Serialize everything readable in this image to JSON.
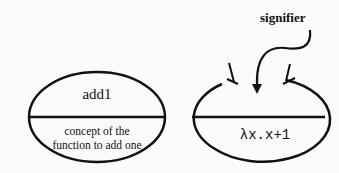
{
  "diagram": {
    "left_sign": {
      "signifier_text": "add1",
      "signified_text": "concept of the function to add one",
      "signified_lines": [
        "concept of the",
        "function to add one"
      ]
    },
    "right_sign": {
      "annotation": "signifier",
      "signified_text": "λx.x+1"
    }
  }
}
